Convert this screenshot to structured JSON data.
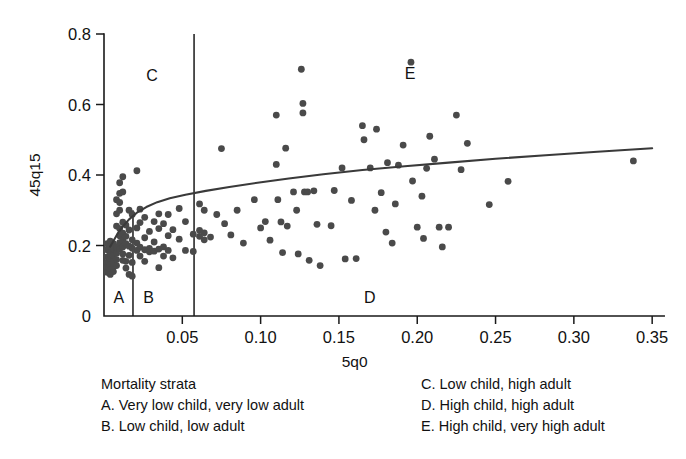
{
  "chart_data": {
    "type": "scatter",
    "title": "",
    "xlabel": "5q0",
    "ylabel": "45q15",
    "xlim": [
      0,
      0.355
    ],
    "ylim": [
      0,
      0.8
    ],
    "grid": false,
    "legend_position": "below-plot",
    "x_ticks": [
      0.05,
      0.1,
      0.15,
      0.2,
      0.25,
      0.3,
      0.35
    ],
    "x_tick_labels": [
      "0.05",
      "0.10",
      "0.15",
      "0.20",
      "0.25",
      "0.30",
      "0.35"
    ],
    "y_ticks": [
      0,
      0.2,
      0.4,
      0.6,
      0.8
    ],
    "y_tick_labels": [
      "0",
      "0.2",
      "0.4",
      "0.6",
      "0.8"
    ],
    "strata_boundaries_x": [
      0.0185,
      0.0575
    ],
    "region_labels": [
      {
        "text": "A",
        "x": 0.006,
        "y": 0.055
      },
      {
        "text": "B",
        "x": 0.025,
        "y": 0.055
      },
      {
        "text": "C",
        "x": 0.027,
        "y": 0.685
      },
      {
        "text": "D",
        "x": 0.166,
        "y": 0.055
      },
      {
        "text": "E",
        "x": 0.192,
        "y": 0.69
      }
    ],
    "fit_curve": {
      "name": "fitted relationship",
      "x": [
        0.004,
        0.006,
        0.009,
        0.012,
        0.016,
        0.021,
        0.027,
        0.034,
        0.042,
        0.052,
        0.065,
        0.08,
        0.098,
        0.118,
        0.14,
        0.165,
        0.192,
        0.22,
        0.25,
        0.282,
        0.315,
        0.35
      ],
      "y": [
        0.197,
        0.213,
        0.236,
        0.254,
        0.274,
        0.293,
        0.309,
        0.323,
        0.334,
        0.344,
        0.355,
        0.366,
        0.378,
        0.39,
        0.402,
        0.414,
        0.425,
        0.435,
        0.446,
        0.456,
        0.466,
        0.476
      ]
    },
    "points": [
      {
        "x": 0.002,
        "y": 0.205
      },
      {
        "x": 0.002,
        "y": 0.188
      },
      {
        "x": 0.002,
        "y": 0.168
      },
      {
        "x": 0.002,
        "y": 0.152
      },
      {
        "x": 0.002,
        "y": 0.138
      },
      {
        "x": 0.002,
        "y": 0.124
      },
      {
        "x": 0.004,
        "y": 0.212
      },
      {
        "x": 0.004,
        "y": 0.196
      },
      {
        "x": 0.004,
        "y": 0.178
      },
      {
        "x": 0.004,
        "y": 0.16
      },
      {
        "x": 0.004,
        "y": 0.145
      },
      {
        "x": 0.004,
        "y": 0.131
      },
      {
        "x": 0.004,
        "y": 0.118
      },
      {
        "x": 0.006,
        "y": 0.205
      },
      {
        "x": 0.006,
        "y": 0.19
      },
      {
        "x": 0.006,
        "y": 0.172
      },
      {
        "x": 0.006,
        "y": 0.155
      },
      {
        "x": 0.006,
        "y": 0.14
      },
      {
        "x": 0.006,
        "y": 0.126
      },
      {
        "x": 0.008,
        "y": 0.33
      },
      {
        "x": 0.008,
        "y": 0.29
      },
      {
        "x": 0.008,
        "y": 0.255
      },
      {
        "x": 0.008,
        "y": 0.196
      },
      {
        "x": 0.008,
        "y": 0.178
      },
      {
        "x": 0.008,
        "y": 0.16
      },
      {
        "x": 0.008,
        "y": 0.143
      },
      {
        "x": 0.01,
        "y": 0.378
      },
      {
        "x": 0.01,
        "y": 0.348
      },
      {
        "x": 0.01,
        "y": 0.322
      },
      {
        "x": 0.01,
        "y": 0.3
      },
      {
        "x": 0.01,
        "y": 0.248
      },
      {
        "x": 0.01,
        "y": 0.228
      },
      {
        "x": 0.01,
        "y": 0.208
      },
      {
        "x": 0.01,
        "y": 0.19
      },
      {
        "x": 0.012,
        "y": 0.395
      },
      {
        "x": 0.012,
        "y": 0.352
      },
      {
        "x": 0.012,
        "y": 0.266
      },
      {
        "x": 0.012,
        "y": 0.235
      },
      {
        "x": 0.012,
        "y": 0.215
      },
      {
        "x": 0.012,
        "y": 0.196
      },
      {
        "x": 0.012,
        "y": 0.176
      },
      {
        "x": 0.012,
        "y": 0.158
      },
      {
        "x": 0.014,
        "y": 0.258
      },
      {
        "x": 0.014,
        "y": 0.226
      },
      {
        "x": 0.014,
        "y": 0.205
      },
      {
        "x": 0.014,
        "y": 0.155
      },
      {
        "x": 0.014,
        "y": 0.136
      },
      {
        "x": 0.016,
        "y": 0.3
      },
      {
        "x": 0.016,
        "y": 0.244
      },
      {
        "x": 0.016,
        "y": 0.198
      },
      {
        "x": 0.016,
        "y": 0.172
      },
      {
        "x": 0.016,
        "y": 0.118
      },
      {
        "x": 0.018,
        "y": 0.288
      },
      {
        "x": 0.018,
        "y": 0.216
      },
      {
        "x": 0.018,
        "y": 0.192
      },
      {
        "x": 0.018,
        "y": 0.152
      },
      {
        "x": 0.018,
        "y": 0.113
      },
      {
        "x": 0.021,
        "y": 0.412
      },
      {
        "x": 0.021,
        "y": 0.25
      },
      {
        "x": 0.021,
        "y": 0.207
      },
      {
        "x": 0.021,
        "y": 0.186
      },
      {
        "x": 0.023,
        "y": 0.303
      },
      {
        "x": 0.023,
        "y": 0.265
      },
      {
        "x": 0.023,
        "y": 0.195
      },
      {
        "x": 0.023,
        "y": 0.17
      },
      {
        "x": 0.026,
        "y": 0.28
      },
      {
        "x": 0.026,
        "y": 0.222
      },
      {
        "x": 0.026,
        "y": 0.188
      },
      {
        "x": 0.026,
        "y": 0.155
      },
      {
        "x": 0.029,
        "y": 0.24
      },
      {
        "x": 0.029,
        "y": 0.192
      },
      {
        "x": 0.029,
        "y": 0.182
      },
      {
        "x": 0.032,
        "y": 0.268
      },
      {
        "x": 0.032,
        "y": 0.21
      },
      {
        "x": 0.032,
        "y": 0.184
      },
      {
        "x": 0.035,
        "y": 0.29
      },
      {
        "x": 0.035,
        "y": 0.248
      },
      {
        "x": 0.035,
        "y": 0.19
      },
      {
        "x": 0.035,
        "y": 0.137
      },
      {
        "x": 0.038,
        "y": 0.262
      },
      {
        "x": 0.038,
        "y": 0.196
      },
      {
        "x": 0.038,
        "y": 0.17
      },
      {
        "x": 0.041,
        "y": 0.288
      },
      {
        "x": 0.041,
        "y": 0.228
      },
      {
        "x": 0.041,
        "y": 0.186
      },
      {
        "x": 0.044,
        "y": 0.245
      },
      {
        "x": 0.044,
        "y": 0.165
      },
      {
        "x": 0.048,
        "y": 0.305
      },
      {
        "x": 0.048,
        "y": 0.218
      },
      {
        "x": 0.052,
        "y": 0.268
      },
      {
        "x": 0.052,
        "y": 0.186
      },
      {
        "x": 0.057,
        "y": 0.232
      },
      {
        "x": 0.057,
        "y": 0.183
      },
      {
        "x": 0.061,
        "y": 0.318
      },
      {
        "x": 0.061,
        "y": 0.243
      },
      {
        "x": 0.061,
        "y": 0.226
      },
      {
        "x": 0.064,
        "y": 0.3
      },
      {
        "x": 0.064,
        "y": 0.236
      },
      {
        "x": 0.064,
        "y": 0.216
      },
      {
        "x": 0.068,
        "y": 0.224
      },
      {
        "x": 0.072,
        "y": 0.288
      },
      {
        "x": 0.075,
        "y": 0.475
      },
      {
        "x": 0.077,
        "y": 0.262
      },
      {
        "x": 0.081,
        "y": 0.23
      },
      {
        "x": 0.085,
        "y": 0.3
      },
      {
        "x": 0.089,
        "y": 0.207
      },
      {
        "x": 0.096,
        "y": 0.33
      },
      {
        "x": 0.1,
        "y": 0.25
      },
      {
        "x": 0.103,
        "y": 0.268
      },
      {
        "x": 0.106,
        "y": 0.215
      },
      {
        "x": 0.11,
        "y": 0.57
      },
      {
        "x": 0.11,
        "y": 0.43
      },
      {
        "x": 0.111,
        "y": 0.33
      },
      {
        "x": 0.113,
        "y": 0.267
      },
      {
        "x": 0.114,
        "y": 0.18
      },
      {
        "x": 0.116,
        "y": 0.476
      },
      {
        "x": 0.117,
        "y": 0.255
      },
      {
        "x": 0.121,
        "y": 0.352
      },
      {
        "x": 0.123,
        "y": 0.3
      },
      {
        "x": 0.124,
        "y": 0.176
      },
      {
        "x": 0.126,
        "y": 0.7
      },
      {
        "x": 0.127,
        "y": 0.603
      },
      {
        "x": 0.127,
        "y": 0.576
      },
      {
        "x": 0.128,
        "y": 0.352
      },
      {
        "x": 0.13,
        "y": 0.352
      },
      {
        "x": 0.131,
        "y": 0.158
      },
      {
        "x": 0.134,
        "y": 0.355
      },
      {
        "x": 0.136,
        "y": 0.26
      },
      {
        "x": 0.138,
        "y": 0.143
      },
      {
        "x": 0.145,
        "y": 0.256
      },
      {
        "x": 0.147,
        "y": 0.356
      },
      {
        "x": 0.152,
        "y": 0.42
      },
      {
        "x": 0.154,
        "y": 0.162
      },
      {
        "x": 0.158,
        "y": 0.328
      },
      {
        "x": 0.161,
        "y": 0.163
      },
      {
        "x": 0.165,
        "y": 0.54
      },
      {
        "x": 0.166,
        "y": 0.5
      },
      {
        "x": 0.17,
        "y": 0.42
      },
      {
        "x": 0.173,
        "y": 0.3
      },
      {
        "x": 0.174,
        "y": 0.53
      },
      {
        "x": 0.177,
        "y": 0.35
      },
      {
        "x": 0.18,
        "y": 0.238
      },
      {
        "x": 0.181,
        "y": 0.435
      },
      {
        "x": 0.184,
        "y": 0.207
      },
      {
        "x": 0.186,
        "y": 0.318
      },
      {
        "x": 0.188,
        "y": 0.428
      },
      {
        "x": 0.191,
        "y": 0.485
      },
      {
        "x": 0.196,
        "y": 0.72
      },
      {
        "x": 0.197,
        "y": 0.383
      },
      {
        "x": 0.2,
        "y": 0.252
      },
      {
        "x": 0.203,
        "y": 0.34
      },
      {
        "x": 0.204,
        "y": 0.22
      },
      {
        "x": 0.206,
        "y": 0.419
      },
      {
        "x": 0.208,
        "y": 0.51
      },
      {
        "x": 0.211,
        "y": 0.445
      },
      {
        "x": 0.214,
        "y": 0.252
      },
      {
        "x": 0.216,
        "y": 0.196
      },
      {
        "x": 0.22,
        "y": 0.252
      },
      {
        "x": 0.225,
        "y": 0.57
      },
      {
        "x": 0.228,
        "y": 0.415
      },
      {
        "x": 0.232,
        "y": 0.49
      },
      {
        "x": 0.246,
        "y": 0.316
      },
      {
        "x": 0.258,
        "y": 0.382
      },
      {
        "x": 0.338,
        "y": 0.44
      }
    ]
  },
  "legend": {
    "left": [
      "Mortality strata",
      "A. Very low child, very low adult",
      "B. Low child, low adult"
    ],
    "right": [
      "C. Low child, high adult",
      "D. High child, high adult",
      "E. High child, very high adult"
    ]
  }
}
